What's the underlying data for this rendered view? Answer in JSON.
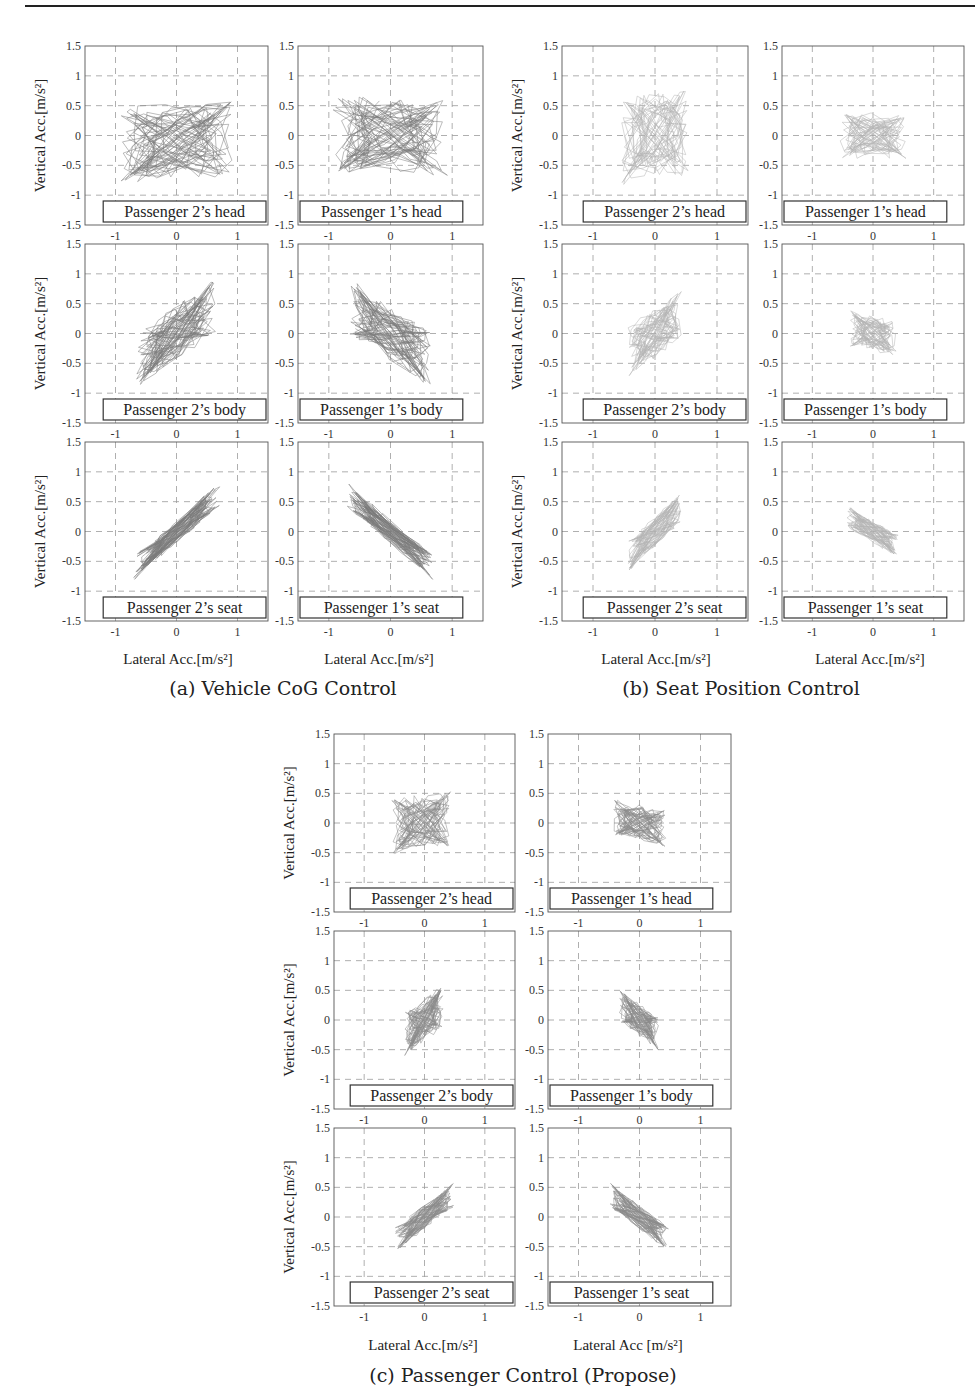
{
  "figure": {
    "axis_ticks": {
      "x": [
        "-1",
        "0",
        "1"
      ],
      "y": [
        "1.5",
        "1",
        "0.5",
        "0",
        "-0.5",
        "-1",
        "-1.5"
      ]
    },
    "y_label": "Vertical Acc.[m/s²]",
    "x_label": "Lateral Acc.[m/s²]",
    "x_label_c2": "Lateral Acc [m/s²]",
    "groups": [
      {
        "id": "a",
        "caption": "(a) Vehicle CoG Control",
        "panels": [
          {
            "label": "Passenger 2’s head",
            "row": 0,
            "col": 0
          },
          {
            "label": "Passenger 1’s head",
            "row": 0,
            "col": 1
          },
          {
            "label": "Passenger 2’s body",
            "row": 1,
            "col": 0
          },
          {
            "label": "Passenger 1’s body",
            "row": 1,
            "col": 1
          },
          {
            "label": "Passenger 2’s seat",
            "row": 2,
            "col": 0
          },
          {
            "label": "Passenger 1’s seat",
            "row": 2,
            "col": 1
          }
        ]
      },
      {
        "id": "b",
        "caption": "(b) Seat Position Control",
        "panels": [
          {
            "label": "Passenger 2’s head",
            "row": 0,
            "col": 0
          },
          {
            "label": "Passenger 1’s head",
            "row": 0,
            "col": 1
          },
          {
            "label": "Passenger 2’s body",
            "row": 1,
            "col": 0
          },
          {
            "label": "Passenger 1’s body",
            "row": 1,
            "col": 1
          },
          {
            "label": "Passenger 2’s seat",
            "row": 2,
            "col": 0
          },
          {
            "label": "Passenger 1’s seat",
            "row": 2,
            "col": 1
          }
        ]
      },
      {
        "id": "c",
        "caption": "(c) Passenger Control (Propose)",
        "panels": [
          {
            "label": "Passenger 2’s head",
            "row": 0,
            "col": 0
          },
          {
            "label": "Passenger 1’s head",
            "row": 0,
            "col": 1
          },
          {
            "label": "Passenger 2’s body",
            "row": 1,
            "col": 0
          },
          {
            "label": "Passenger 1’s body",
            "row": 1,
            "col": 1
          },
          {
            "label": "Passenger 2’s seat",
            "row": 2,
            "col": 0
          },
          {
            "label": "Passenger 1’s seat",
            "row": 2,
            "col": 1
          }
        ]
      }
    ]
  },
  "chart_data": [
    {
      "type": "scatter",
      "group": "(a) Vehicle CoG Control",
      "title": "Passenger 2’s head",
      "xlabel": "Lateral Acc.[m/s²]",
      "ylabel": "Vertical Acc.[m/s²]",
      "xlim": [
        -1.5,
        1.5
      ],
      "ylim": [
        -1.5,
        1.5
      ],
      "grid": true,
      "xticks": [
        -1,
        0,
        1
      ],
      "yticks": [
        -1.5,
        -1,
        -0.5,
        0,
        0.5,
        1,
        1.5
      ],
      "trajectory": {
        "center": [
          0.0,
          -0.1
        ],
        "spread_x": 0.85,
        "spread_y": 0.6,
        "correlation": 0.05,
        "x_range": [
          -1.1,
          1.1
        ],
        "y_range": [
          -1.1,
          1.3
        ]
      }
    },
    {
      "type": "scatter",
      "group": "(a) Vehicle CoG Control",
      "title": "Passenger 1’s head",
      "xlabel": "",
      "ylabel": "",
      "xlim": [
        -1.5,
        1.5
      ],
      "ylim": [
        -1.5,
        1.5
      ],
      "grid": true,
      "trajectory": {
        "center": [
          0.0,
          0.0
        ],
        "spread_x": 0.85,
        "spread_y": 0.6,
        "correlation": -0.05,
        "x_range": [
          -1.4,
          1.4
        ],
        "y_range": [
          -1.0,
          1.2
        ]
      }
    },
    {
      "type": "scatter",
      "group": "(a) Vehicle CoG Control",
      "title": "Passenger 2’s body",
      "xlabel": "",
      "ylabel": "Vertical Acc.[m/s²]",
      "xlim": [
        -1.5,
        1.5
      ],
      "ylim": [
        -1.5,
        1.5
      ],
      "grid": true,
      "trajectory": {
        "center": [
          0.0,
          0.0
        ],
        "spread_x": 0.6,
        "spread_y": 0.6,
        "correlation": 0.7,
        "x_range": [
          -1.0,
          1.0
        ],
        "y_range": [
          -1.0,
          1.2
        ]
      }
    },
    {
      "type": "scatter",
      "group": "(a) Vehicle CoG Control",
      "title": "Passenger 1’s body",
      "xlabel": "",
      "ylabel": "",
      "xlim": [
        -1.5,
        1.5
      ],
      "ylim": [
        -1.5,
        1.5
      ],
      "grid": true,
      "trajectory": {
        "center": [
          0.0,
          0.0
        ],
        "spread_x": 0.6,
        "spread_y": 0.6,
        "correlation": -0.7,
        "x_range": [
          -1.0,
          1.0
        ],
        "y_range": [
          -1.0,
          1.2
        ]
      }
    },
    {
      "type": "scatter",
      "group": "(a) Vehicle CoG Control",
      "title": "Passenger 2’s seat",
      "xlabel": "Lateral Acc.[m/s²]",
      "ylabel": "Vertical Acc.[m/s²]",
      "xlim": [
        -1.5,
        1.5
      ],
      "ylim": [
        -1.5,
        1.5
      ],
      "grid": true,
      "trajectory": {
        "center": [
          0.0,
          0.0
        ],
        "spread_x": 0.65,
        "spread_y": 0.6,
        "correlation": 0.95,
        "x_range": [
          -1.2,
          1.2
        ],
        "y_range": [
          -1.1,
          1.15
        ]
      }
    },
    {
      "type": "scatter",
      "group": "(a) Vehicle CoG Control",
      "title": "Passenger 1’s seat",
      "xlabel": "Lateral Acc.[m/s²]",
      "ylabel": "",
      "xlim": [
        -1.5,
        1.5
      ],
      "ylim": [
        -1.5,
        1.5
      ],
      "grid": true,
      "trajectory": {
        "center": [
          0.0,
          0.0
        ],
        "spread_x": 0.65,
        "spread_y": 0.6,
        "correlation": -0.95,
        "x_range": [
          -1.1,
          1.2
        ],
        "y_range": [
          -1.1,
          1.0
        ]
      }
    },
    {
      "type": "scatter",
      "group": "(b) Seat Position Control",
      "title": "Passenger 2’s head",
      "xlabel": "",
      "ylabel": "Vertical Acc.[m/s²]",
      "xlim": [
        -1.5,
        1.5
      ],
      "ylim": [
        -1.5,
        1.5
      ],
      "grid": true,
      "trajectory": {
        "center": [
          0.0,
          0.0
        ],
        "spread_x": 0.5,
        "spread_y": 0.7,
        "correlation": 0.1,
        "x_range": [
          -0.9,
          0.9
        ],
        "y_range": [
          -1.1,
          1.5
        ]
      }
    },
    {
      "type": "scatter",
      "group": "(b) Seat Position Control",
      "title": "Passenger 1’s head",
      "xlabel": "",
      "ylabel": "",
      "xlim": [
        -1.5,
        1.5
      ],
      "ylim": [
        -1.5,
        1.5
      ],
      "grid": true,
      "trajectory": {
        "center": [
          0.0,
          0.0
        ],
        "spread_x": 0.5,
        "spread_y": 0.35,
        "correlation": 0.0,
        "x_range": [
          -0.9,
          0.9
        ],
        "y_range": [
          -0.75,
          0.9
        ]
      }
    },
    {
      "type": "scatter",
      "group": "(b) Seat Position Control",
      "title": "Passenger 2’s body",
      "xlabel": "",
      "ylabel": "Vertical Acc.[m/s²]",
      "xlim": [
        -1.5,
        1.5
      ],
      "ylim": [
        -1.5,
        1.5
      ],
      "grid": true,
      "trajectory": {
        "center": [
          0.0,
          0.0
        ],
        "spread_x": 0.4,
        "spread_y": 0.5,
        "correlation": 0.6,
        "x_range": [
          -0.8,
          0.8
        ],
        "y_range": [
          -1.0,
          1.3
        ]
      }
    },
    {
      "type": "scatter",
      "group": "(b) Seat Position Control",
      "title": "Passenger 1’s body",
      "xlabel": "",
      "ylabel": "",
      "xlim": [
        -1.5,
        1.5
      ],
      "ylim": [
        -1.5,
        1.5
      ],
      "grid": true,
      "trajectory": {
        "center": [
          0.0,
          0.0
        ],
        "spread_x": 0.35,
        "spread_y": 0.3,
        "correlation": -0.3,
        "x_range": [
          -0.6,
          0.6
        ],
        "y_range": [
          -0.6,
          0.7
        ]
      }
    },
    {
      "type": "scatter",
      "group": "(b) Seat Position Control",
      "title": "Passenger 2’s seat",
      "xlabel": "Lateral Acc.[m/s²]",
      "ylabel": "Vertical Acc.[m/s²]",
      "xlim": [
        -1.5,
        1.5
      ],
      "ylim": [
        -1.5,
        1.5
      ],
      "grid": true,
      "trajectory": {
        "center": [
          0.0,
          0.0
        ],
        "spread_x": 0.4,
        "spread_y": 0.45,
        "correlation": 0.85,
        "x_range": [
          -0.7,
          0.8
        ],
        "y_range": [
          -0.9,
          1.1
        ]
      }
    },
    {
      "type": "scatter",
      "group": "(b) Seat Position Control",
      "title": "Passenger 1’s seat",
      "xlabel": "Lateral Acc.[m/s²]",
      "ylabel": "",
      "xlim": [
        -1.5,
        1.5
      ],
      "ylim": [
        -1.5,
        1.5
      ],
      "grid": true,
      "trajectory": {
        "center": [
          0.0,
          0.0
        ],
        "spread_x": 0.4,
        "spread_y": 0.3,
        "correlation": -0.8,
        "x_range": [
          -0.7,
          0.75
        ],
        "y_range": [
          -0.6,
          0.6
        ]
      }
    },
    {
      "type": "scatter",
      "group": "(c) Passenger Control (Propose)",
      "title": "Passenger 2’s head",
      "xlabel": "",
      "ylabel": "Vertical Acc.[m/s²]",
      "xlim": [
        -1.5,
        1.5
      ],
      "ylim": [
        -1.5,
        1.5
      ],
      "grid": true,
      "trajectory": {
        "center": [
          -0.05,
          0.0
        ],
        "spread_x": 0.45,
        "spread_y": 0.45,
        "correlation": 0.1,
        "x_range": [
          -0.9,
          0.9
        ],
        "y_range": [
          -1.05,
          1.3
        ]
      }
    },
    {
      "type": "scatter",
      "group": "(c) Passenger Control (Propose)",
      "title": "Passenger 1’s head",
      "xlabel": "",
      "ylabel": "",
      "xlim": [
        -1.5,
        1.5
      ],
      "ylim": [
        -1.5,
        1.5
      ],
      "grid": true,
      "trajectory": {
        "center": [
          0.0,
          0.0
        ],
        "spread_x": 0.4,
        "spread_y": 0.3,
        "correlation": -0.3,
        "x_range": [
          -0.9,
          0.9
        ],
        "y_range": [
          -0.8,
          1.0
        ]
      }
    },
    {
      "type": "scatter",
      "group": "(c) Passenger Control (Propose)",
      "title": "Passenger 2’s body",
      "xlabel": "",
      "ylabel": "Vertical Acc.[m/s²]",
      "xlim": [
        -1.5,
        1.5
      ],
      "ylim": [
        -1.5,
        1.5
      ],
      "grid": true,
      "trajectory": {
        "center": [
          0.0,
          0.0
        ],
        "spread_x": 0.3,
        "spread_y": 0.4,
        "correlation": 0.55,
        "x_range": [
          -0.6,
          0.6
        ],
        "y_range": [
          -1.0,
          1.2
        ]
      }
    },
    {
      "type": "scatter",
      "group": "(c) Passenger Control (Propose)",
      "title": "Passenger 1’s body",
      "xlabel": "",
      "ylabel": "",
      "xlim": [
        -1.5,
        1.5
      ],
      "ylim": [
        -1.5,
        1.5
      ],
      "grid": true,
      "trajectory": {
        "center": [
          0.0,
          0.0
        ],
        "spread_x": 0.3,
        "spread_y": 0.35,
        "correlation": -0.65,
        "x_range": [
          -0.5,
          0.7
        ],
        "y_range": [
          -0.8,
          0.9
        ]
      }
    },
    {
      "type": "scatter",
      "group": "(c) Passenger Control (Propose)",
      "title": "Passenger 2’s seat",
      "xlabel": "Lateral Acc.[m/s²]",
      "ylabel": "Vertical Acc.[m/s²]",
      "xlim": [
        -1.5,
        1.5
      ],
      "ylim": [
        -1.5,
        1.5
      ],
      "grid": true,
      "trajectory": {
        "center": [
          0.0,
          0.0
        ],
        "spread_x": 0.45,
        "spread_y": 0.4,
        "correlation": 0.88,
        "x_range": [
          -0.8,
          0.85
        ],
        "y_range": [
          -0.9,
          0.85
        ]
      }
    },
    {
      "type": "scatter",
      "group": "(c) Passenger Control (Propose)",
      "title": "Passenger 1’s seat",
      "xlabel": "Lateral Acc [m/s²]",
      "ylabel": "",
      "xlim": [
        -1.5,
        1.5
      ],
      "ylim": [
        -1.5,
        1.5
      ],
      "grid": true,
      "trajectory": {
        "center": [
          0.0,
          0.0
        ],
        "spread_x": 0.45,
        "spread_y": 0.4,
        "correlation": -0.88,
        "x_range": [
          -0.8,
          0.85
        ],
        "y_range": [
          -0.9,
          1.1
        ]
      }
    }
  ],
  "render": {
    "stroke": {
      "a": "#7a7a7a",
      "b": "#b4b4b4",
      "c": "#8a8a8a"
    },
    "density": {
      "a": 26,
      "b": 22,
      "c": 24
    }
  }
}
